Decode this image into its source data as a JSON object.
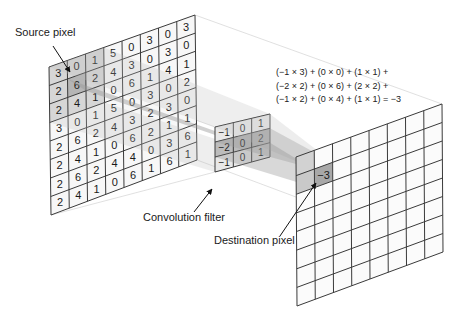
{
  "labels": {
    "source_pixel": "Source pixel",
    "convolution_filter": "Convolution filter",
    "destination_pixel": "Destination pixel"
  },
  "formula": {
    "lines": [
      "(−1 × 3) + (0 × 0) + (1 × 1) +",
      "(−2 × 2) + (0 × 6) + (2 × 2) +",
      "(−1 × 2) + (0 × 4) + (1 × 1) = −3"
    ]
  },
  "input_grid": {
    "rows": 8,
    "cols": 8,
    "values": [
      [
        3,
        0,
        1,
        5,
        0,
        3,
        0,
        3
      ],
      [
        2,
        6,
        2,
        4,
        3,
        0,
        3,
        0
      ],
      [
        2,
        4,
        1,
        0,
        6,
        1,
        4,
        1
      ],
      [
        3,
        0,
        1,
        5,
        0,
        3,
        0,
        2
      ],
      [
        2,
        6,
        2,
        4,
        3,
        2,
        3,
        0
      ],
      [
        2,
        4,
        1,
        0,
        6,
        2,
        1,
        1
      ],
      [
        2,
        6,
        2,
        4,
        4,
        0,
        3,
        6
      ],
      [
        2,
        4,
        1,
        0,
        6,
        1,
        6,
        1
      ]
    ],
    "highlight_window": {
      "row": 0,
      "col": 0,
      "size": 3
    },
    "source_pixel": {
      "row": 1,
      "col": 1
    }
  },
  "filter_grid": {
    "rows": 3,
    "cols": 3,
    "values": [
      [
        -1,
        0,
        1
      ],
      [
        -2,
        0,
        2
      ],
      [
        -1,
        0,
        1
      ]
    ]
  },
  "output_grid": {
    "rows": 8,
    "cols": 8,
    "destination_pixel": {
      "row": 1,
      "col": 1,
      "value": "−3"
    }
  },
  "colors": {
    "grid_line": "#3a3a3a",
    "cell_fill": "#f7f7f7",
    "highlight": "#c8c8c8",
    "beam": "#9a9a9a",
    "text": "#1a1a1a"
  }
}
